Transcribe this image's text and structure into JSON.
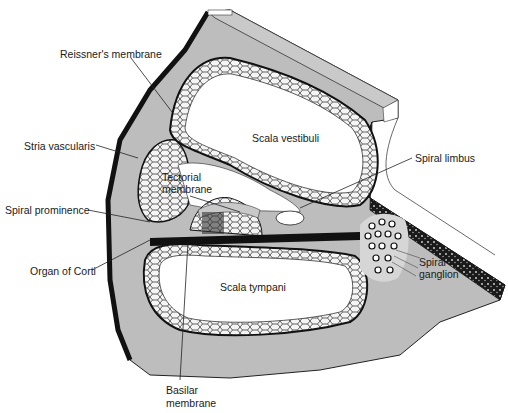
{
  "diagram": {
    "colors": {
      "bone": "#bdbdbd",
      "outline": "#111111",
      "cavity": "#ffffff",
      "background": "#ffffff"
    },
    "chambers": {
      "scala_vestibuli": "Scala vestibuli",
      "scala_tympani": "Scala tympani"
    },
    "labels": {
      "reissners_membrane": "Reissner's membrane",
      "stria_vascularis": "Stria vascularis",
      "tectorial_membrane_line1": "Tectorial",
      "tectorial_membrane_line2": "membrane",
      "spiral_prominence": "Spiral prominence",
      "organ_of_corti": "Organ of Corti",
      "basilar_membrane_line1": "Basilar",
      "basilar_membrane_line2": "membrane",
      "spiral_limbus": "Spiral limbus",
      "spiral_ganglion_line1": "Spiral",
      "spiral_ganglion_line2": "ganglion"
    }
  }
}
